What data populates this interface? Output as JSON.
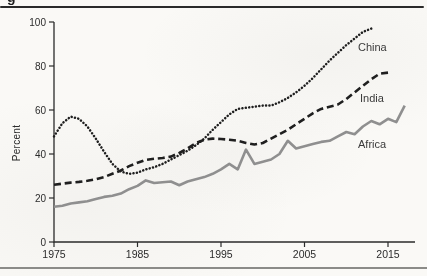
{
  "page": {
    "caption_fragment": "g"
  },
  "chart_data": {
    "type": "line",
    "title": "",
    "xlabel": "",
    "ylabel": "Percent",
    "ylim": [
      0,
      100
    ],
    "xlim": [
      1975,
      2018
    ],
    "y_ticks": [
      0,
      20,
      40,
      60,
      80,
      100
    ],
    "x_ticks": [
      1975,
      1985,
      1995,
      2005,
      2015
    ],
    "grid": false,
    "legend_position": "inline-labels-right",
    "axis_color": "#2b2b2b",
    "series": [
      {
        "name": "China",
        "style": "dotted",
        "color": "#1f1f1f",
        "points": [
          [
            1975,
            48
          ],
          [
            1976,
            54
          ],
          [
            1977,
            57
          ],
          [
            1978,
            56
          ],
          [
            1979,
            52.5
          ],
          [
            1980,
            47
          ],
          [
            1981,
            41
          ],
          [
            1982,
            35.5
          ],
          [
            1983,
            32
          ],
          [
            1984,
            31
          ],
          [
            1985,
            31.5
          ],
          [
            1986,
            33
          ],
          [
            1987,
            34
          ],
          [
            1988,
            35.5
          ],
          [
            1989,
            37.5
          ],
          [
            1990,
            39.5
          ],
          [
            1991,
            41.5
          ],
          [
            1992,
            44
          ],
          [
            1993,
            47
          ],
          [
            1994,
            51
          ],
          [
            1995,
            54.5
          ],
          [
            1996,
            58
          ],
          [
            1997,
            60.5
          ],
          [
            1998,
            61
          ],
          [
            1999,
            61.5
          ],
          [
            2000,
            62
          ],
          [
            2001,
            62
          ],
          [
            2002,
            63.5
          ],
          [
            2003,
            65.5
          ],
          [
            2004,
            68
          ],
          [
            2005,
            71
          ],
          [
            2006,
            74.5
          ],
          [
            2007,
            78.5
          ],
          [
            2008,
            82.5
          ],
          [
            2009,
            86
          ],
          [
            2010,
            89.5
          ],
          [
            2011,
            92.5
          ],
          [
            2012,
            95.5
          ],
          [
            2013,
            97
          ]
        ]
      },
      {
        "name": "India",
        "style": "dashed",
        "color": "#1f1f1f",
        "points": [
          [
            1975,
            26
          ],
          [
            1976,
            26.5
          ],
          [
            1977,
            27
          ],
          [
            1978,
            27.3
          ],
          [
            1979,
            27.8
          ],
          [
            1980,
            28.5
          ],
          [
            1981,
            29.5
          ],
          [
            1982,
            31
          ],
          [
            1983,
            32.5
          ],
          [
            1984,
            34.5
          ],
          [
            1985,
            36
          ],
          [
            1986,
            37.3
          ],
          [
            1987,
            37.8
          ],
          [
            1988,
            38.2
          ],
          [
            1989,
            38.8
          ],
          [
            1990,
            40.5
          ],
          [
            1991,
            42.5
          ],
          [
            1992,
            45
          ],
          [
            1993,
            46.5
          ],
          [
            1994,
            47
          ],
          [
            1995,
            46.8
          ],
          [
            1996,
            46.5
          ],
          [
            1997,
            46
          ],
          [
            1998,
            45
          ],
          [
            1999,
            44.3
          ],
          [
            2000,
            45
          ],
          [
            2001,
            47
          ],
          [
            2002,
            49
          ],
          [
            2003,
            51
          ],
          [
            2004,
            53.5
          ],
          [
            2005,
            56
          ],
          [
            2006,
            58.5
          ],
          [
            2007,
            60.5
          ],
          [
            2008,
            61.5
          ],
          [
            2009,
            62.5
          ],
          [
            2010,
            65
          ],
          [
            2011,
            68
          ],
          [
            2012,
            71
          ],
          [
            2013,
            74
          ],
          [
            2014,
            76.5
          ],
          [
            2015,
            77
          ]
        ]
      },
      {
        "name": "Africa",
        "style": "solid",
        "color": "#8f8f8f",
        "points": [
          [
            1975,
            16
          ],
          [
            1976,
            16.5
          ],
          [
            1977,
            17.5
          ],
          [
            1978,
            18
          ],
          [
            1979,
            18.5
          ],
          [
            1980,
            19.5
          ],
          [
            1981,
            20.5
          ],
          [
            1982,
            21
          ],
          [
            1983,
            22
          ],
          [
            1984,
            24
          ],
          [
            1985,
            25.5
          ],
          [
            1986,
            28
          ],
          [
            1987,
            26.8
          ],
          [
            1988,
            27.2
          ],
          [
            1989,
            27.5
          ],
          [
            1990,
            25.8
          ],
          [
            1991,
            27.5
          ],
          [
            1992,
            28.5
          ],
          [
            1993,
            29.5
          ],
          [
            1994,
            31
          ],
          [
            1995,
            33
          ],
          [
            1996,
            35.5
          ],
          [
            1997,
            33
          ],
          [
            1998,
            42
          ],
          [
            1999,
            35.5
          ],
          [
            2000,
            36.5
          ],
          [
            2001,
            37.5
          ],
          [
            2002,
            40
          ],
          [
            2003,
            46
          ],
          [
            2004,
            42.5
          ],
          [
            2005,
            43.5
          ],
          [
            2006,
            44.5
          ],
          [
            2007,
            45.5
          ],
          [
            2008,
            46
          ],
          [
            2009,
            48
          ],
          [
            2010,
            50
          ],
          [
            2011,
            49
          ],
          [
            2012,
            52.5
          ],
          [
            2013,
            55
          ],
          [
            2014,
            53.5
          ],
          [
            2015,
            56
          ],
          [
            2016,
            54.5
          ],
          [
            2017,
            62
          ]
        ]
      }
    ]
  }
}
